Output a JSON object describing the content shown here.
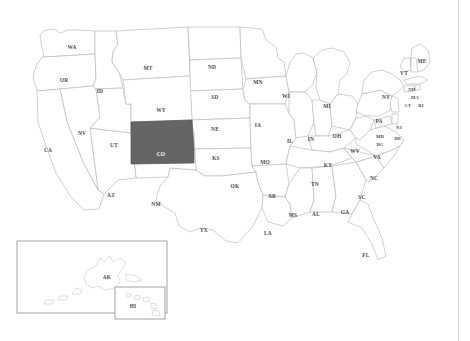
{
  "map": {
    "title": "United States map with Colorado highlighted",
    "background_color": "#ffffff",
    "state_fill": "#ffffff",
    "state_border_color": "#bcbcbc",
    "highlight_fill": "#656565",
    "highlight_label_color": "#ffffff",
    "label_color": "#4a4a4a",
    "selected_state": "CO",
    "inset_border_color": "#9a9a9a"
  },
  "labels": {
    "wa": "WA",
    "or": "OR",
    "id": "ID",
    "mt": "MT",
    "nd": "ND",
    "mn": "MN",
    "wi": "WI",
    "mi": "MI",
    "ny": "NY",
    "me": "ME",
    "vt": "VT",
    "nh": "NH",
    "ma": "MA",
    "ct": "CT",
    "ri": "RI",
    "pa": "PA",
    "nj": "NJ",
    "sd": "SD",
    "wy": "WY",
    "nv": "NV",
    "ca": "CA",
    "ut": "UT",
    "co": "CO",
    "ne": "NE",
    "ia": "IA",
    "il": "IL",
    "in": "IN",
    "oh": "OH",
    "md": "MD",
    "dc": "DC",
    "de": "DE",
    "wv": "WV",
    "va": "VA",
    "ks": "KS",
    "mo": "MO",
    "ky": "KY",
    "nc": "NC",
    "az": "AZ",
    "nm": "NM",
    "ok": "OK",
    "ar": "AR",
    "tn": "TN",
    "sc": "SC",
    "ms": "MS",
    "al": "AL",
    "ga": "GA",
    "tx": "TX",
    "la": "LA",
    "fl": "FL",
    "ak": "AK",
    "hi": "HI"
  },
  "insets": {
    "alaska_label": "AK",
    "hawaii_label": "HI"
  }
}
